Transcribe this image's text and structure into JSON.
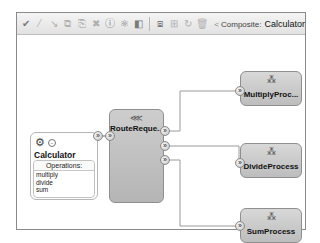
{
  "toolbar": {
    "icons": [
      {
        "name": "validate-check-icon",
        "glyph": "✔",
        "enabled": true
      },
      {
        "name": "wire-icon",
        "glyph": "⁄",
        "enabled": false
      },
      {
        "name": "connector-icon",
        "glyph": "↘",
        "enabled": false
      },
      {
        "name": "copy-icon",
        "glyph": "⧉",
        "enabled": false
      },
      {
        "name": "paste-icon",
        "glyph": "⎘",
        "enabled": false
      },
      {
        "name": "delete-icon",
        "glyph": "✖",
        "enabled": false
      },
      {
        "name": "info-icon",
        "glyph": "ⓘ",
        "enabled": true
      },
      {
        "name": "test-icon",
        "glyph": "⚛",
        "enabled": true
      },
      {
        "name": "deploy-icon",
        "glyph": "◧",
        "enabled": true
      },
      {
        "name": "zoom-fit-icon",
        "glyph": "⧈",
        "enabled": true
      },
      {
        "name": "layout-icon",
        "glyph": "⊞",
        "enabled": false
      },
      {
        "name": "refresh-icon",
        "glyph": "↻",
        "enabled": false
      },
      {
        "name": "trash-icon",
        "glyph": "🗑",
        "enabled": false
      }
    ],
    "breadcrumb": {
      "arrow": "<",
      "label": "Composite:",
      "value": "Calculator"
    }
  },
  "service": {
    "icon": "gear-cluster-icon",
    "title": "Calculator",
    "operations_header": "Operations:",
    "operations": [
      "multiply",
      "divide",
      "sum"
    ]
  },
  "router": {
    "icon": "router-icon",
    "name": "RouteReque..."
  },
  "processes": [
    {
      "name": "MultiplyProc...",
      "icon": "process-icon"
    },
    {
      "name": "DivideProcess",
      "icon": "process-icon"
    },
    {
      "name": "SumProcess",
      "icon": "process-icon"
    }
  ],
  "port_glyph": "»"
}
